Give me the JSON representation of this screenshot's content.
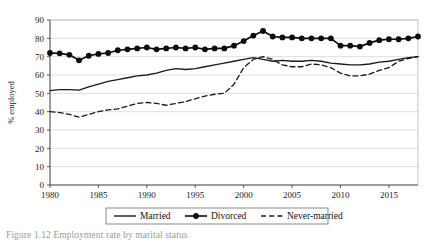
{
  "figure": {
    "caption": "Figure 1.12  Employment rate by marital status"
  },
  "chart_data": {
    "type": "line",
    "title": "",
    "xlabel": "",
    "ylabel": "% employed",
    "xlim": [
      1980,
      2018
    ],
    "ylim": [
      0,
      90
    ],
    "ytick_step": 10,
    "yticks": [
      0,
      10,
      20,
      30,
      40,
      50,
      60,
      70,
      80,
      90
    ],
    "xticks": [
      1980,
      1985,
      1990,
      1995,
      2000,
      2005,
      2010,
      2015
    ],
    "grid": "horizontal",
    "legend_position": "bottom",
    "x": [
      1980,
      1981,
      1982,
      1983,
      1984,
      1985,
      1986,
      1987,
      1988,
      1989,
      1990,
      1991,
      1992,
      1993,
      1994,
      1995,
      1996,
      1997,
      1998,
      1999,
      2000,
      2001,
      2002,
      2003,
      2004,
      2005,
      2006,
      2007,
      2008,
      2009,
      2010,
      2011,
      2012,
      2013,
      2014,
      2015,
      2016,
      2017,
      2018
    ],
    "series": [
      {
        "name": "Married",
        "style": "solid",
        "marker": "none",
        "color": "#1a1a1a",
        "values": [
          51.5,
          52.0,
          52.0,
          51.8,
          53.5,
          55.0,
          56.5,
          57.5,
          58.5,
          59.5,
          60.0,
          61.0,
          62.5,
          63.5,
          63.0,
          63.5,
          64.5,
          65.5,
          66.5,
          67.5,
          68.5,
          69.5,
          68.5,
          67.5,
          68.0,
          67.5,
          67.5,
          68.0,
          67.5,
          66.5,
          66.0,
          65.5,
          65.5,
          66.0,
          67.0,
          67.5,
          68.5,
          69.5,
          70.0
        ]
      },
      {
        "name": "Divorced",
        "style": "solid",
        "marker": "filled-circle",
        "color": "#0d0d0d",
        "values": [
          72.0,
          71.8,
          71.0,
          68.0,
          70.5,
          71.5,
          72.0,
          73.5,
          74.0,
          74.5,
          75.0,
          74.0,
          74.5,
          75.0,
          74.5,
          75.0,
          74.0,
          74.5,
          74.5,
          76.0,
          78.5,
          81.5,
          84.0,
          81.0,
          80.5,
          80.5,
          80.0,
          80.0,
          80.0,
          80.0,
          76.0,
          76.0,
          75.5,
          77.5,
          79.0,
          79.5,
          79.5,
          80.0,
          81.0
        ]
      },
      {
        "name": "Never-married",
        "style": "dashed",
        "marker": "none",
        "color": "#1a1a1a",
        "values": [
          40.0,
          39.5,
          38.5,
          37.0,
          38.5,
          40.0,
          41.0,
          41.5,
          43.0,
          44.5,
          45.0,
          44.5,
          43.5,
          44.5,
          45.5,
          47.0,
          48.5,
          49.5,
          50.0,
          55.0,
          64.0,
          68.5,
          70.0,
          68.5,
          65.5,
          64.5,
          64.5,
          66.0,
          65.5,
          64.0,
          61.0,
          59.5,
          59.5,
          60.5,
          62.5,
          64.0,
          67.5,
          69.0,
          70.0
        ]
      }
    ],
    "legend": [
      {
        "label": "Married",
        "style": "solid",
        "marker": "none"
      },
      {
        "label": "Divorced",
        "style": "solid",
        "marker": "filled-circle"
      },
      {
        "label": "Never-married",
        "style": "dashed",
        "marker": "none"
      }
    ]
  }
}
